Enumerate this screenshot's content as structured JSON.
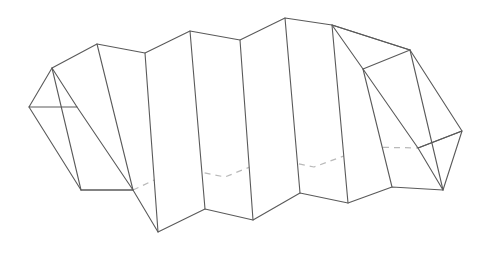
{
  "figure": {
    "type": "line-diagram",
    "canvas": {
      "width": 488,
      "height": 255
    },
    "style": {
      "background_color": "#ffffff",
      "visible_edge_color": "#5a5a5a",
      "hidden_edge_color": "#b9b9b9",
      "face_fill_color": "#ffffff",
      "visible_edge_width": 1.1,
      "hidden_edge_width": 1.25,
      "hidden_edge_dash": "6 5"
    },
    "geometry": {
      "top_ridge_label": "top zigzag ridge line",
      "top_ridge": "52,68 97,44 145,53 190,31 240,40 285,18 332,25 410,50",
      "near_bottom_label": "front lower zigzag edge",
      "near_bottom": "81,190 133,190 158,232 205,209 253,220 300,193 348,203 392,187 443,190",
      "left_cap_label": "left triangular end cap",
      "left_cap": "52,68 29,107 77,107 52,68",
      "left_cap_lower_label": "left lower end face",
      "left_cap_lower": "29,107 81,190 133,190 77,107",
      "right_cap_upper_label": "right upper triangular cap",
      "right_cap_upper": "332,25 410,50 363,69 332,25",
      "right_cap_lower_label": "right lower triangular cap",
      "right_cap_lower": "462,131 418,148 443,190 462,131",
      "right_side_label": "right side quadrilateral face",
      "right_side": "410,50 462,131 418,148 363,69",
      "hidden_ridge_label": "hidden rear zigzag (dashed)",
      "hidden_ridge": "133,190 180,168 225,177 272,158 314,167 368,147 418,148",
      "lateral_edges_label": "slanted lateral fold edges",
      "lateral_edges": [
        "52,68 81,190",
        "97,44 133,190",
        "145,53 158,232",
        "190,31 205,209",
        "240,40 253,220",
        "285,18 300,193",
        "332,25 348,203",
        "363,69 392,187",
        "410,50 443,190"
      ],
      "vertex_counts": {
        "top_ridge_vertices": 8,
        "bottom_ridge_vertices": 9,
        "hidden_ridge_vertices": 7,
        "lateral_edge_count": 9
      }
    }
  }
}
